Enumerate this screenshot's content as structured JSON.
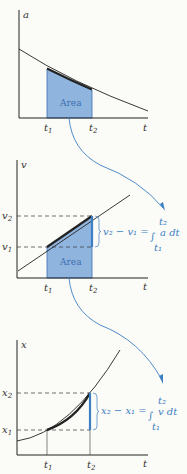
{
  "panels": [
    {
      "y_axis": "a",
      "x_axis": "t",
      "t1": "t",
      "t1_sub": "1",
      "t2": "t",
      "t2_sub": "2",
      "area_label": "Area"
    },
    {
      "y_axis": "v",
      "x_axis": "t",
      "t1": "t",
      "t1_sub": "1",
      "t2": "t",
      "t2_sub": "2",
      "area_label": "Area",
      "y1": "v",
      "y1_sub": "1",
      "y2": "v",
      "y2_sub": "2",
      "eq_lhs": "v₂ − v₁ =",
      "eq_integrand": "a dt",
      "eq_upper": "t₂",
      "eq_lower": "t₁"
    },
    {
      "y_axis": "x",
      "x_axis": "t",
      "t1": "t",
      "t1_sub": "1",
      "t2": "t",
      "t2_sub": "2",
      "y1": "x",
      "y1_sub": "1",
      "y2": "x",
      "y2_sub": "2",
      "eq_lhs": "x₂ − x₁ =",
      "eq_integrand": "v dt",
      "eq_upper": "t₂",
      "eq_lower": "t₁"
    }
  ],
  "colors": {
    "fill": "#8fb4de",
    "accent": "#3d7fc4",
    "line": "#222222"
  }
}
